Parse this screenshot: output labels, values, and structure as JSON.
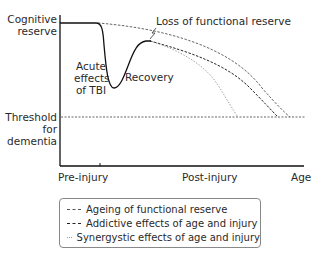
{
  "diagram": {
    "y_axis_labels": {
      "top": [
        "Cognitive",
        "reserve"
      ],
      "threshold": [
        "Threshold",
        "for",
        "dementia"
      ]
    },
    "x_axis_labels": [
      "Pre-injury",
      "Post-injury",
      "Age"
    ],
    "annotations": {
      "loss": "Loss of functional reserve",
      "acute": [
        "Acute",
        "effects",
        "of TBI"
      ],
      "recovery": "Recovery"
    },
    "curves": [
      {
        "name": "Ageing of functional reserve",
        "style": "dashed",
        "color": "#555555"
      },
      {
        "name": "Addictive effects of age and injury",
        "style": "dashed",
        "color": "#222222"
      },
      {
        "name": "Synergystic effects of age and injury",
        "style": "dotted",
        "color": "#999999"
      }
    ]
  },
  "legend": {
    "items": [
      {
        "label": "Ageing of functional reserve",
        "color": "#555555"
      },
      {
        "label": "Addictive effects of age and injury",
        "color": "#222222"
      },
      {
        "label": "Synergystic effects of age and injury",
        "color": "#999999"
      }
    ]
  }
}
